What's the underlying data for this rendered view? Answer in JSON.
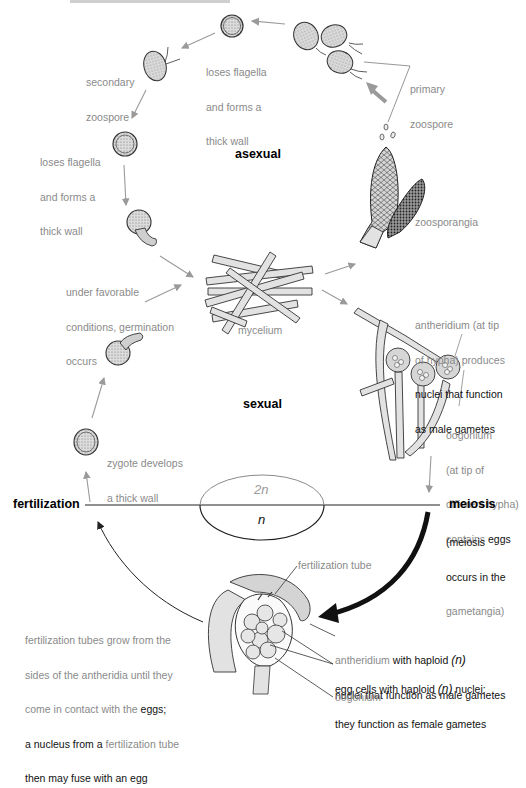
{
  "title_cropped": "...",
  "sections": {
    "asexual": "asexual",
    "sexual": "sexual"
  },
  "stages": {
    "fertilization": "fertilization",
    "meiosis": "meiosis",
    "meiosis_note_1": "(meiosis",
    "meiosis_note_2": "occurs in the",
    "meiosis_note_3": "gametangia)"
  },
  "ploidy": {
    "diploid": "2n",
    "haploid": "n"
  },
  "labels": {
    "loses_flagella_top": [
      "loses flagella",
      "and forms a",
      "thick wall"
    ],
    "secondary_zoospore": [
      "secondary",
      "zoospore"
    ],
    "loses_flagella_left": [
      "loses flagella",
      "and forms a",
      "thick wall"
    ],
    "primary_zoospore": [
      "primary",
      "zoospore"
    ],
    "zoosporangia": "zoosporangia",
    "germination": [
      "under favorable",
      "conditions, germination",
      "occurs"
    ],
    "mycelium": "mycelium",
    "antheridium_tip": {
      "gray": [
        "antheridium (at tip",
        "of hypha) produces"
      ],
      "dark": [
        "nuclei that function",
        "as male gametes"
      ]
    },
    "oogonium_tip": {
      "gray": [
        "oogonium",
        "(at tip of",
        "different hypha)",
        "contains"
      ],
      "dark": "eggs"
    },
    "zygote": [
      "zygote develops",
      "a thick wall"
    ],
    "fertilization_tube": "fertilization tube",
    "fertilization_text": {
      "line1": "fertilization tubes grow from the",
      "line2": "sides of the antheridia until they",
      "line3_gray": "come in contact with the ",
      "line3_dark": "eggs;",
      "line4_dark": "a nucleus from a ",
      "line4_gray": "fertilization tube",
      "line5_dark": "then may fuse with an egg"
    },
    "antheridium_haploid": {
      "gray": "antheridium",
      "dark1": " with haploid ",
      "n": "(n)",
      "dark2": "nuclei that function as male gametes"
    },
    "egg_cells": {
      "line1a": "egg cells with haploid ",
      "n": "(n)",
      "line1b": " nuclei;",
      "line2": "they function as female gametes"
    },
    "oogonium_bottom": "oogonium"
  },
  "colors": {
    "gray_text": "#8a8a8a",
    "dark_text": "#111111",
    "arrow_gray": "#9a9a9a",
    "cell_fill": "#d9d9d9",
    "hypha_fill": "#e2e2e2"
  }
}
